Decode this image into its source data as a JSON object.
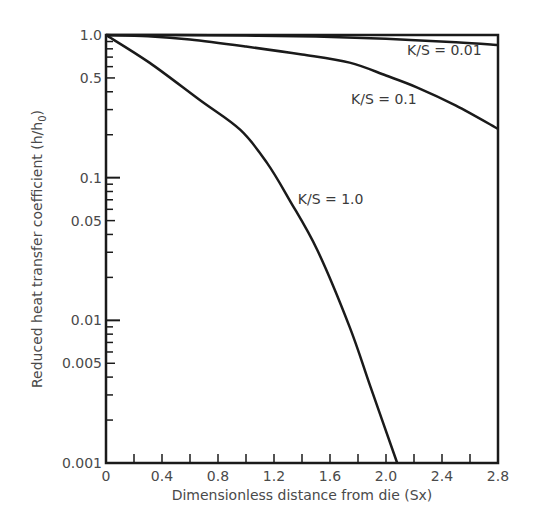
{
  "chart_data": {
    "type": "line",
    "title": "",
    "xlabel": "Dimensionless distance from die (Sx)",
    "ylabel": "Reduced heat transfer coefficient (h/h",
    "ylabel_subscript": "0",
    "ylabel_close": ")",
    "xlim": [
      0,
      2.8
    ],
    "ylim": [
      0.001,
      1.0
    ],
    "yscale": "log",
    "grid": false,
    "x_ticks": [
      0,
      0.2,
      0.4,
      0.6,
      0.8,
      1.0,
      1.2,
      1.4,
      1.6,
      1.8,
      2.0,
      2.2,
      2.4,
      2.6,
      2.8
    ],
    "x_tick_labels": [
      {
        "value": 0,
        "label": "0"
      },
      {
        "value": 0.4,
        "label": "0.4"
      },
      {
        "value": 0.8,
        "label": "0.8"
      },
      {
        "value": 1.2,
        "label": "1.2"
      },
      {
        "value": 1.6,
        "label": "1.6"
      },
      {
        "value": 2.0,
        "label": "2.0"
      },
      {
        "value": 2.4,
        "label": "2.4"
      },
      {
        "value": 2.8,
        "label": "2.8"
      }
    ],
    "y_tick_labels": [
      {
        "value": 1.0,
        "label": "1.0"
      },
      {
        "value": 0.5,
        "label": "0.5"
      },
      {
        "value": 0.1,
        "label": "0.1"
      },
      {
        "value": 0.05,
        "label": "0.05"
      },
      {
        "value": 0.01,
        "label": "0.01"
      },
      {
        "value": 0.005,
        "label": "0.005"
      },
      {
        "value": 0.001,
        "label": "0.001"
      }
    ],
    "series": [
      {
        "name": "K/S = 0.01",
        "x": [
          0,
          0.5,
          1.0,
          1.5,
          2.0,
          2.5,
          2.8
        ],
        "values": [
          1.0,
          0.998,
          0.99,
          0.975,
          0.94,
          0.89,
          0.85
        ]
      },
      {
        "name": "K/S = 0.1",
        "x": [
          0,
          0.3,
          0.6,
          1.0,
          1.4,
          1.74,
          2.0,
          2.22,
          2.5,
          2.8
        ],
        "values": [
          1.0,
          0.98,
          0.93,
          0.83,
          0.73,
          0.64,
          0.52,
          0.43,
          0.32,
          0.22
        ]
      },
      {
        "name": "K/S = 1.0",
        "x": [
          0,
          0.31,
          0.67,
          0.96,
          1.15,
          1.31,
          1.51,
          1.74,
          1.89,
          2.08
        ],
        "values": [
          1.0,
          0.64,
          0.35,
          0.216,
          0.127,
          0.07,
          0.031,
          0.009,
          0.0034,
          0.001
        ]
      }
    ],
    "annotations": [
      {
        "text": "K/S = 0.01",
        "x": 2.15,
        "y": 0.72
      },
      {
        "text": "K/S = 0.1",
        "x": 1.75,
        "y": 0.33
      },
      {
        "text": "K/S = 1.0",
        "x": 1.37,
        "y": 0.065
      }
    ],
    "colors": {
      "line": "#1a1a1a",
      "axis": "#1a1a1a",
      "text": "#4a4a4a"
    }
  }
}
